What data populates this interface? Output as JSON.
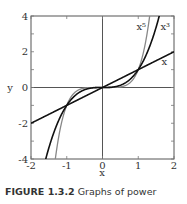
{
  "caption": {
    "figure_number": "FIGURE 1.3.2",
    "text": "Graphs of power"
  },
  "chart_data": {
    "type": "line",
    "title": "",
    "xlabel": "x",
    "ylabel": "y",
    "xlim": [
      -2,
      2
    ],
    "ylim": [
      -4,
      4
    ],
    "xticks": [
      -2,
      -1,
      0,
      1,
      2
    ],
    "yticks": [
      -4,
      -2,
      0,
      2,
      4
    ],
    "grid": false,
    "legend": "inline labels near curves",
    "series": [
      {
        "name": "x",
        "label": "x",
        "function": "x",
        "color": "#111111",
        "x": [
          -2,
          -1,
          0,
          1,
          2
        ],
        "values": [
          -2,
          -1,
          0,
          1,
          2
        ]
      },
      {
        "name": "x^3",
        "label": "x³",
        "function": "x^3",
        "color": "#111111",
        "x": [
          -1.587,
          -1,
          -0.5,
          0,
          0.5,
          1,
          1.587
        ],
        "values": [
          -4,
          -1,
          -0.125,
          0,
          0.125,
          1,
          4
        ]
      },
      {
        "name": "x^5",
        "label": "x⁵",
        "function": "x^5",
        "color": "#888888",
        "x": [
          -1.32,
          -1,
          -0.5,
          0,
          0.5,
          1,
          1.32
        ],
        "values": [
          -4,
          -1,
          -0.031,
          0,
          0.031,
          1,
          4
        ]
      }
    ],
    "annotations": [
      {
        "text": "x⁵",
        "x": 0.95,
        "y": 3.2
      },
      {
        "text": "x³",
        "x": 1.62,
        "y": 3.2
      },
      {
        "text": "x",
        "x": 1.65,
        "y": 1.25
      }
    ]
  },
  "layout": {
    "plot_left": 31,
    "plot_right": 174,
    "plot_top": 16,
    "plot_bottom": 159
  }
}
